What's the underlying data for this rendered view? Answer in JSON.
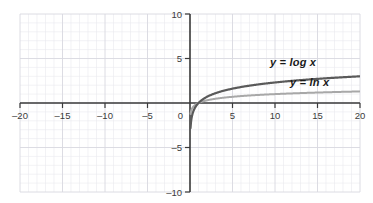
{
  "chart_data": {
    "type": "line",
    "title": "",
    "subtitle": "",
    "xlabel": "",
    "ylabel": "",
    "xlim": [
      -20,
      20
    ],
    "ylim": [
      -10,
      10
    ],
    "xticks": [
      -20,
      -15,
      -10,
      -5,
      0,
      5,
      10,
      15,
      20
    ],
    "xticklabels": [
      "-20",
      "-15",
      "-10",
      "-5",
      "0",
      "5",
      "10",
      "15",
      "20"
    ],
    "yticks": [
      -10,
      -5,
      5,
      10
    ],
    "yticklabels": [
      "-10",
      "-5",
      "5",
      "10"
    ],
    "grid": true,
    "grid_minor_step": 1,
    "grid_major_step": 5,
    "legend_position": "inline-annotation",
    "axes_style": "cartesian-cross",
    "series": [
      {
        "name": "y = log x",
        "label": "y = log x",
        "color": "#5a5a5a",
        "width": 2.2,
        "domain": [
          0,
          20
        ],
        "x": [
          0.05,
          0.1,
          0.2,
          0.3,
          0.5,
          0.75,
          1,
          1.5,
          2,
          3,
          4,
          5,
          6,
          7,
          8,
          9,
          10,
          12,
          14,
          16,
          18,
          20
        ],
        "y": [
          -1.301,
          -1.0,
          -0.699,
          -0.523,
          -0.301,
          -0.125,
          0,
          0.176,
          0.301,
          0.477,
          0.602,
          0.699,
          0.778,
          0.845,
          0.903,
          0.954,
          1.0,
          1.079,
          1.146,
          1.204,
          1.255,
          1.301
        ],
        "y_scaled_note": "drawn curve reaches about 3 at x=20"
      },
      {
        "name": "y = ln x",
        "label": "y = ln x",
        "color": "#a8a8a8",
        "width": 2.0,
        "domain": [
          0,
          20
        ],
        "x": [
          0.05,
          0.1,
          0.2,
          0.3,
          0.5,
          0.75,
          1,
          1.5,
          2,
          3,
          4,
          5,
          6,
          7,
          8,
          9,
          10,
          12,
          14,
          16,
          18,
          20
        ],
        "y": [
          -3.0,
          -2.303,
          -1.609,
          -1.204,
          -0.693,
          -0.288,
          0,
          0.405,
          0.693,
          1.099,
          1.386,
          1.609,
          1.792,
          1.946,
          2.079,
          2.197,
          2.303,
          2.485,
          2.639,
          2.773,
          2.89,
          2.996
        ],
        "y_scaled_note": "drawn curve reaches about 1.3 at x=20"
      }
    ],
    "annotations": [
      {
        "text": "y = log x",
        "x": 12.5,
        "y": 4.0
      },
      {
        "text": "y = ln x",
        "x": 15.0,
        "y": 2.2
      }
    ]
  },
  "colors": {
    "background": "#ffffff",
    "axis": "#3b3b3b",
    "grid_minor": "#e9e9ee",
    "grid_major": "#d8d8e0",
    "tick_label": "#3b3b3b",
    "curve_log": "#5a5a5a",
    "curve_ln": "#a8a8a8",
    "annotation": "#1a1a1a"
  },
  "labels": {
    "log_curve": "y = log x",
    "ln_curve": "y = ln x"
  }
}
